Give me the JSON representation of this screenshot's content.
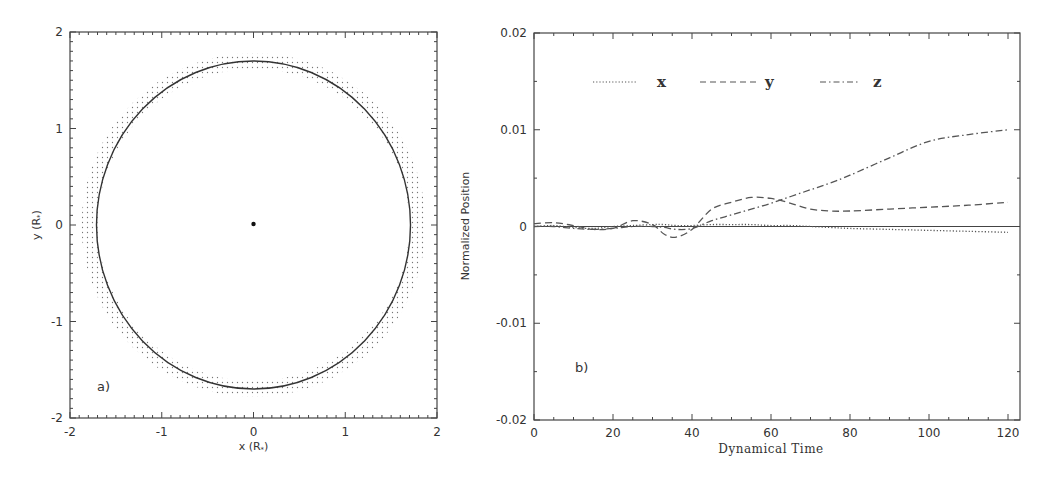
{
  "chart_data": [
    {
      "id": "a",
      "type": "scatter",
      "panel_label": "a)",
      "title": "",
      "xlabel": "x (R*)",
      "ylabel": "y (R*)",
      "xlim": [
        -2,
        2
      ],
      "ylim": [
        -2,
        2
      ],
      "xticks": [
        "-2",
        "-1",
        "0",
        "1",
        "2"
      ],
      "yticks": [
        "-2",
        "-1",
        "0",
        "1",
        "2"
      ],
      "grid": false,
      "elements": {
        "circle_radius": 1.7,
        "center_point": [
          0,
          0
        ],
        "dotted_ring_inner_radius": 1.7,
        "dotted_ring_outer_radius": 1.88
      }
    },
    {
      "id": "b",
      "type": "line",
      "panel_label": "b)",
      "title": "",
      "xlabel": "Dynamical Time",
      "ylabel": "Normalized Position",
      "xlim": [
        0,
        120
      ],
      "ylim": [
        -0.02,
        0.02
      ],
      "xticks": [
        "0",
        "20",
        "40",
        "60",
        "80",
        "100",
        "120"
      ],
      "yticks": [
        "-0.02",
        "-0.01",
        "0",
        "0.01",
        "0.02"
      ],
      "grid": false,
      "legend_position": "top inside",
      "legend": [
        {
          "name": "x",
          "style": "dotted"
        },
        {
          "name": "y",
          "style": "dashed"
        },
        {
          "name": "z",
          "style": "dash-dot"
        }
      ],
      "x": [
        0,
        5,
        10,
        15,
        20,
        25,
        30,
        33,
        36,
        40,
        45,
        50,
        55,
        60,
        65,
        70,
        75,
        80,
        90,
        100,
        110,
        120
      ],
      "series": [
        {
          "name": "x",
          "style": "dotted",
          "values": [
            0.0,
            0.0001,
            -0.0001,
            -0.0002,
            0.0,
            0.0001,
            0.0002,
            0.0002,
            0.0001,
            0.0001,
            0.0002,
            0.0002,
            0.0002,
            0.0001,
            0.0001,
            0.0,
            -0.0001,
            -0.0002,
            -0.0003,
            -0.0004,
            -0.0005,
            -0.0006
          ]
        },
        {
          "name": "y",
          "style": "dashed",
          "values": [
            0.0003,
            0.0004,
            0.0001,
            -0.0003,
            -0.0002,
            0.0006,
            0.0002,
            -0.0008,
            -0.0011,
            -0.0003,
            0.0018,
            0.0025,
            0.003,
            0.0029,
            0.0024,
            0.0018,
            0.0016,
            0.0016,
            0.0018,
            0.002,
            0.0022,
            0.0025
          ]
        },
        {
          "name": "z",
          "style": "dash-dot",
          "values": [
            0.0,
            0.0,
            -0.0002,
            -0.0003,
            -0.0002,
            0.0,
            0.0,
            -0.0001,
            -0.0003,
            -0.0002,
            0.0006,
            0.0012,
            0.0018,
            0.0024,
            0.0031,
            0.0038,
            0.0045,
            0.0053,
            0.0071,
            0.0088,
            0.0095,
            0.01
          ]
        }
      ]
    }
  ],
  "panel_a": {
    "label": "a)",
    "xlabel": "x (R",
    "ylabel": "y (R",
    "label_suffix": ")",
    "xticks": [
      "-2",
      "-1",
      "0",
      "1",
      "2"
    ],
    "yticks": [
      "-2",
      "-1",
      "0",
      "1",
      "2"
    ]
  },
  "panel_b": {
    "label": "b)",
    "xlabel": "Dynamical Time",
    "ylabel": "Normalized Position",
    "xticks": [
      "0",
      "20",
      "40",
      "60",
      "80",
      "100",
      "120"
    ],
    "yticks": [
      "0.02",
      "0.01",
      "0",
      "-0.01",
      "-0.02"
    ],
    "legend": [
      "x",
      "y",
      "z"
    ]
  },
  "colors": {
    "ink": "#333333",
    "frame": "#444444",
    "dots": "#666666"
  }
}
